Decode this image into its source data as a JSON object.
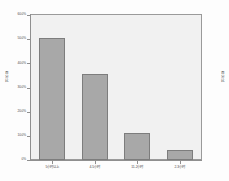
{
  "chart_data": {
    "type": "bar",
    "title": "",
    "subtitle": "",
    "xlabel": "",
    "ylabel": "百分比",
    "right_label": "百分比",
    "categories": [
      "5小时以上",
      "4-5小时",
      "11-2小时",
      "2-3小时"
    ],
    "values": [
      50.5,
      35.5,
      11.0,
      4.0
    ],
    "value_labels": [
      "50.5%",
      "35.5%",
      "11.0%",
      "4.0%"
    ],
    "ylim": [
      0,
      60
    ],
    "ytick_values": [
      0,
      10,
      20,
      30,
      40,
      50,
      60
    ],
    "ytick_labels": [
      "0%",
      "10.0%",
      "20.0%",
      "30.0%",
      "40.0%",
      "50.0%",
      "60.0%"
    ],
    "grid": false,
    "legend": false,
    "legend_position": "none",
    "bar_color": "#a8a8a8",
    "bar_border_color": "#7d7d7d",
    "plot_background": "#f1f1f1",
    "axis_color": "#8f8f8f",
    "text_color": "#4a4a4a"
  }
}
